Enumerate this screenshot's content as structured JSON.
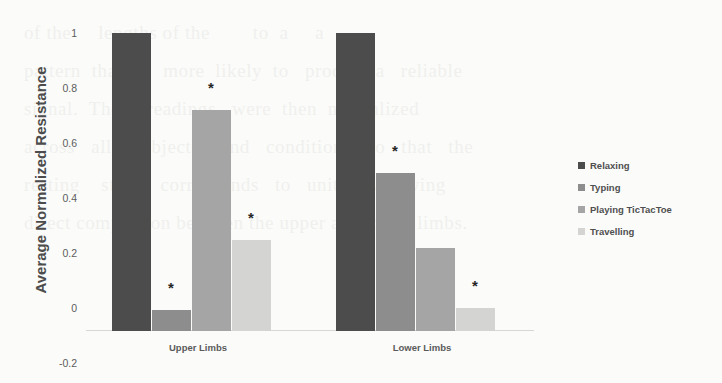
{
  "chart_data": {
    "type": "bar",
    "title": "",
    "xlabel": "",
    "ylabel": "Average Normalized Resistance",
    "categories": [
      "Upper Limbs",
      "Lower Limbs"
    ],
    "yticks": [
      "1",
      "0.8",
      "0.6",
      "0.4",
      "0.2",
      "0",
      "-0.2"
    ],
    "ytick_values": [
      1,
      0.8,
      0.6,
      0.4,
      0.2,
      0,
      -0.2
    ],
    "ylim": [
      -0.085,
      1.02
    ],
    "grid": false,
    "legend_position": "right",
    "series": [
      {
        "name": "Relaxing",
        "color": "#4c4c4c",
        "values": [
          1.0,
          1.0
        ],
        "significance": [
          "",
          ""
        ]
      },
      {
        "name": "Typing",
        "color": "#8d8d8d",
        "values": [
          -0.01,
          0.49
        ],
        "significance": [
          "*",
          "*"
        ]
      },
      {
        "name": "Playing TicTacToe",
        "color": "#a5a5a5",
        "values": [
          0.72,
          0.215
        ],
        "significance": [
          "*",
          ""
        ]
      },
      {
        "name": "Travelling",
        "color": "#d4d4d2",
        "values": [
          0.245,
          0.0
        ],
        "significance": [
          "*",
          "*"
        ]
      }
    ]
  },
  "ghost_text": "of the     lengths of the        to  a     a\npattern  that  is   more  likely  to   produce a   reliable\nsignal.  The     readings   were  then  normalized\nacross   all    subjects    and   conditions   so   that   the\nresting    state    corresponds   to   unity,    allowing\ndirect comparison between the upper and lower limbs."
}
